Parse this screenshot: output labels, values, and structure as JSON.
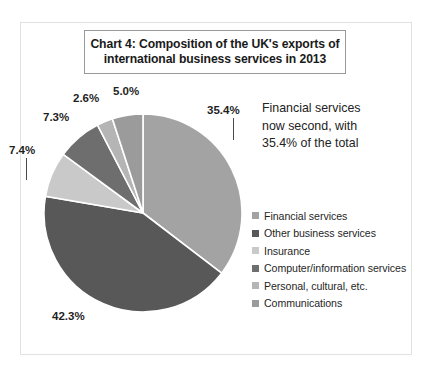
{
  "frame": {
    "border_color": "#e2e2e2",
    "background": "#ffffff"
  },
  "title": {
    "line1": "Chart 4: Composition of the UK's exports of",
    "line2": "international business services in 2013",
    "border_color": "#9a9a9a"
  },
  "annotation": {
    "line1": "Financial services",
    "line2": "now second, with",
    "line3": "35.4% of the total"
  },
  "legend": {
    "items": [
      {
        "label": "Financial services",
        "color": "#a3a3a3"
      },
      {
        "label": "Other business services",
        "color": "#585858"
      },
      {
        "label": "Insurance",
        "color": "#c9c9c9"
      },
      {
        "label": "Computer/information services",
        "color": "#6e6e6e"
      },
      {
        "label": "Personal, cultural, etc.",
        "color": "#b5b5b5"
      },
      {
        "label": "Communications",
        "color": "#9b9b9b"
      }
    ]
  },
  "labels": {
    "financial": "35.4%",
    "other": "42.3%",
    "insurance": "7.4%",
    "computer": "7.3%",
    "personal": "2.6%",
    "communications": "5.0%"
  },
  "chart_data": {
    "type": "pie",
    "title": "Chart 4: Composition of the UK's exports of international business services in 2013",
    "unit": "percent",
    "start_angle_deg": 0,
    "direction": "clockwise",
    "legend_position": "right",
    "grid": false,
    "categories": [
      "Financial services",
      "Other business services",
      "Insurance",
      "Computer/information services",
      "Personal, cultural, etc.",
      "Communications"
    ],
    "values": [
      35.4,
      42.3,
      7.4,
      7.3,
      2.6,
      5.0
    ],
    "labels": [
      "35.4%",
      "42.3%",
      "7.4%",
      "7.3%",
      "2.6%",
      "5.0%"
    ],
    "colors": [
      "#a3a3a3",
      "#585858",
      "#c9c9c9",
      "#6e6e6e",
      "#b5b5b5",
      "#9b9b9b"
    ],
    "slice_border_color": "#ffffff",
    "annotation": "Financial services now second, with 35.4% of the total"
  }
}
